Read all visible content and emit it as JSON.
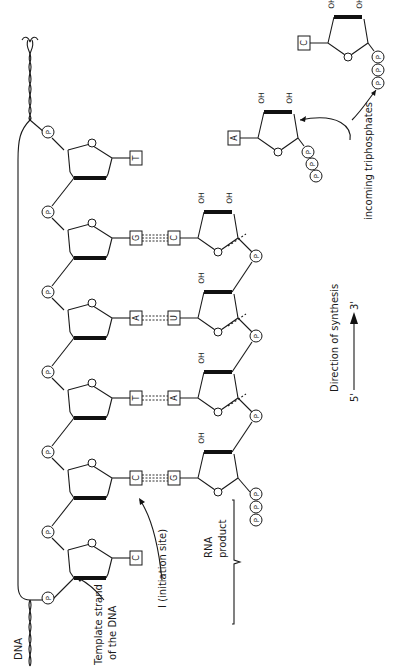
{
  "figure": {
    "orientation": "rotated-90-ccw",
    "labels": {
      "dna": "DNA",
      "template_strand": "Template strand of the DNA",
      "template_line1": "Template strand",
      "template_line2": "of the DNA",
      "initiation_site": "I (initiation site)",
      "rna_product_line1": "RNA",
      "rna_product_line2": "product",
      "direction": "Direction of synthesis",
      "five_prime": "5'",
      "three_prime": "3'",
      "incoming": "incoming  triphosphates",
      "phosphate": "P",
      "hydroxyl": "OH",
      "ring_oxygen": "O"
    },
    "template_bases": [
      "C",
      "C",
      "T",
      "A",
      "G",
      "T"
    ],
    "base_pairs": [
      {
        "dna": "C",
        "rna": "G",
        "hbonds": 3
      },
      {
        "dna": "T",
        "rna": "A",
        "hbonds": 2
      },
      {
        "dna": "A",
        "rna": "U",
        "hbonds": 2
      },
      {
        "dna": "G",
        "rna": "C",
        "hbonds": 3
      }
    ],
    "incoming_nucleotides": [
      {
        "base": "A",
        "phosphates": 3
      },
      {
        "base": "C",
        "phosphates": 3
      }
    ],
    "rna_5prime_triphosphate": 3
  }
}
